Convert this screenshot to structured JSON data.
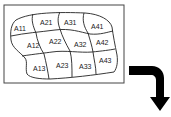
{
  "diagram": {
    "cells": [
      {
        "label": "A11",
        "x": 20,
        "y": 29
      },
      {
        "label": "A21",
        "x": 47,
        "y": 23
      },
      {
        "label": "A31",
        "x": 70,
        "y": 23
      },
      {
        "label": "A41",
        "x": 97,
        "y": 27
      },
      {
        "label": "A12",
        "x": 33,
        "y": 47
      },
      {
        "label": "A22",
        "x": 55,
        "y": 43
      },
      {
        "label": "A32",
        "x": 80,
        "y": 46
      },
      {
        "label": "A42",
        "x": 103,
        "y": 44
      },
      {
        "label": "A13",
        "x": 38,
        "y": 70
      },
      {
        "label": "A23",
        "x": 62,
        "y": 67
      },
      {
        "label": "A33",
        "x": 86,
        "y": 68
      },
      {
        "label": "A43",
        "x": 105,
        "y": 62
      }
    ],
    "colors": {
      "stroke": "#222222",
      "arrow": "#000000",
      "background": "#ffffff"
    }
  }
}
